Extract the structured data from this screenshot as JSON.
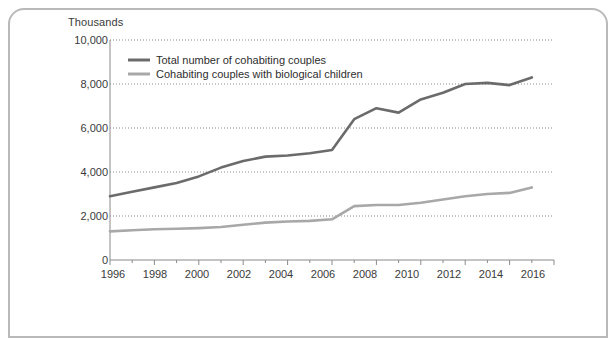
{
  "figure": {
    "unit_label": "Thousands",
    "border_color": "#b9b9b9",
    "background": "#ffffff"
  },
  "legend": {
    "position": "top-left-inside",
    "entries": [
      {
        "label": "Total number of cohabiting couples",
        "color": "#6b6b6b"
      },
      {
        "label": "Cohabiting couples with biological children",
        "color": "#a8a8a8"
      }
    ]
  },
  "axes": {
    "y_tick_labels": [
      "10,000",
      "8,000",
      "6,000",
      "4,000",
      "2,000",
      "0"
    ],
    "x_tick_labels": [
      "1996",
      "1998",
      "2000",
      "2002",
      "2004",
      "2006",
      "2008",
      "2010",
      "2012",
      "2014",
      "2016"
    ]
  },
  "chart_data": {
    "type": "line",
    "title": "",
    "subtitle": "",
    "xlabel": "",
    "ylabel": "Thousands",
    "xlim": [
      1996,
      2016
    ],
    "ylim": [
      0,
      10000
    ],
    "y_ticks": [
      0,
      2000,
      4000,
      6000,
      8000,
      10000
    ],
    "x_ticks": [
      1996,
      1997,
      1998,
      1999,
      2000,
      2001,
      2002,
      2003,
      2004,
      2005,
      2006,
      2007,
      2008,
      2009,
      2010,
      2011,
      2012,
      2013,
      2014,
      2015,
      2016
    ],
    "x_tick_labels_every": 2,
    "grid": "horizontal-dotted",
    "legend_position": "upper left",
    "x": [
      1996,
      1997,
      1998,
      1999,
      2000,
      2001,
      2002,
      2003,
      2004,
      2005,
      2006,
      2007,
      2008,
      2009,
      2010,
      2011,
      2012,
      2013,
      2014,
      2015
    ],
    "series": [
      {
        "name": "Total number of cohabiting couples",
        "color": "#6b6b6b",
        "values": [
          2900,
          3100,
          3300,
          3500,
          3800,
          4200,
          4500,
          4700,
          4750,
          4850,
          5000,
          6400,
          6900,
          6700,
          7300,
          7600,
          8000,
          8050,
          7950,
          8300
        ]
      },
      {
        "name": "Cohabiting couples with biological children",
        "color": "#a8a8a8",
        "values": [
          1300,
          1350,
          1400,
          1420,
          1450,
          1500,
          1600,
          1700,
          1750,
          1780,
          1850,
          2450,
          2500,
          2500,
          2600,
          2750,
          2900,
          3000,
          3050,
          3300
        ]
      }
    ]
  }
}
